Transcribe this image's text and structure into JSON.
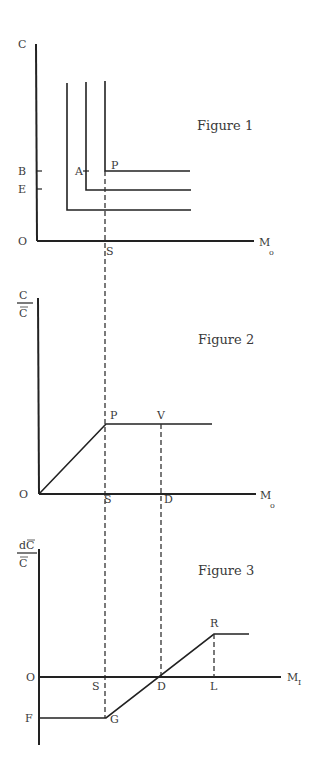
{
  "colors": {
    "ink": "#222222",
    "label": "#3a3a3a",
    "background": "#ffffff"
  },
  "figure1": {
    "title": "Figure 1",
    "y_label": "C",
    "x_label": "M",
    "x_label_sub": "o",
    "origin_label": "O",
    "tick_labels": {
      "B": "B",
      "E": "E"
    },
    "point_labels": {
      "A": "A",
      "P": "P",
      "S": "S"
    }
  },
  "figure2": {
    "title": "Figure 2",
    "y_label_num": "C",
    "y_label_den": "C",
    "x_label": "M",
    "x_label_sub": "o",
    "origin_label": "O",
    "point_labels": {
      "P": "P",
      "V": "V",
      "S": "S",
      "D": "D"
    }
  },
  "figure3": {
    "title": "Figure 3",
    "y_label_num": "dC",
    "y_label_den": "C",
    "x_label": "M",
    "x_label_sub": "I",
    "origin_label": "O",
    "point_labels": {
      "F": "F",
      "S": "S",
      "G": "G",
      "D": "D",
      "L": "L",
      "R": "R"
    }
  }
}
